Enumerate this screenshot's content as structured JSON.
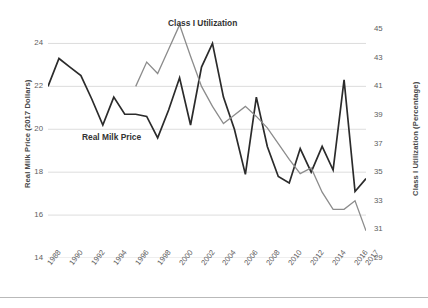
{
  "chart_data": {
    "type": "line",
    "title": "",
    "subtitle": "",
    "xlabel": "",
    "ylabel": "Real Milk Price (2017 Dollars)",
    "ylabel_right": "Class I Utilization (Percentage)",
    "grid": true,
    "legend_position": "inline-annotation",
    "x": [
      1988,
      1989,
      1990,
      1991,
      1992,
      1993,
      1994,
      1995,
      1996,
      1997,
      1998,
      1999,
      2000,
      2001,
      2002,
      2003,
      2004,
      2005,
      2006,
      2007,
      2008,
      2009,
      2010,
      2011,
      2012,
      2013,
      2014,
      2015,
      2016,
      2017
    ],
    "xticklabels": [
      "1988",
      "1990",
      "1992",
      "1994",
      "1996",
      "1998",
      "2000",
      "2002",
      "2004",
      "2006",
      "2008",
      "2010",
      "2012",
      "2014",
      "2016",
      "2017"
    ],
    "xtickvalues": [
      1988,
      1990,
      1992,
      1994,
      1996,
      1998,
      2000,
      2002,
      2004,
      2006,
      2008,
      2010,
      2012,
      2014,
      2016,
      2017
    ],
    "ylim": [
      14,
      25
    ],
    "yticks": [
      14,
      16,
      18,
      20,
      22,
      24
    ],
    "yticklabels": [
      "14",
      "16",
      "18",
      "20",
      "22",
      "24"
    ],
    "ylim_right": [
      29,
      45.5
    ],
    "yticks_right": [
      29,
      31,
      33,
      35,
      37,
      39,
      41,
      43,
      45
    ],
    "yticklabels_right": [
      "29",
      "31",
      "33",
      "35",
      "37",
      "39",
      "41",
      "43",
      "45"
    ],
    "series": [
      {
        "name": "Real Milk Price",
        "axis": "left",
        "color": "#2b2b2b",
        "width": 1.7,
        "values": [
          22.0,
          23.3,
          22.9,
          22.5,
          21.4,
          20.2,
          21.5,
          20.7,
          20.7,
          20.6,
          19.6,
          20.9,
          22.4,
          20.2,
          22.9,
          24.0,
          21.5,
          20.0,
          17.9,
          21.5,
          19.2,
          17.8,
          17.5,
          19.1,
          18.0,
          19.2,
          18.1,
          22.3,
          17.1,
          17.7
        ]
      },
      {
        "name": "Class I Utilization",
        "axis": "right",
        "color": "#8c8c8c",
        "width": 1.3,
        "values": [
          null,
          null,
          null,
          null,
          null,
          null,
          null,
          null,
          41.0,
          42.7,
          41.9,
          43.6,
          45.3,
          43.1,
          41.0,
          39.6,
          38.4,
          39.0,
          39.6,
          38.9,
          38.1,
          37.0,
          35.9,
          34.9,
          35.3,
          33.6,
          32.4,
          32.4,
          33.0,
          30.9
        ]
      }
    ],
    "annotations": [
      {
        "id": "class1",
        "text": "Class I Utilization",
        "series": "Class I Utilization"
      },
      {
        "id": "milk",
        "text": "Real Milk Price",
        "series": "Real Milk Price"
      }
    ]
  },
  "caption": {
    "text": ""
  }
}
